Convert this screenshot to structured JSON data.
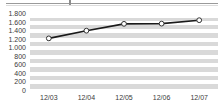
{
  "chart_data": {
    "type": "line",
    "title": "",
    "subtitle": "",
    "xlabel": "",
    "ylabel": "",
    "categories": [
      "12/03",
      "12/04",
      "12/05",
      "12/06",
      "12/07"
    ],
    "values": [
      1230,
      1410,
      1570,
      1575,
      1655
    ],
    "series": [
      {
        "name": "",
        "values": [
          1230,
          1410,
          1570,
          1575,
          1655
        ]
      }
    ],
    "ytick_labels": [
      "1.800",
      "1.600",
      "1.400",
      "1.200",
      "1.000",
      "800",
      "600",
      "400",
      "200",
      "0"
    ],
    "ytick_values": [
      1800,
      1600,
      1400,
      1200,
      1000,
      800,
      600,
      400,
      200,
      0
    ],
    "ylim": [
      0,
      1800
    ],
    "grid": true,
    "grid_style": "horizontal-banded",
    "legend": "none",
    "marker": "open-circle",
    "colors": {
      "line": "#1a1a1a",
      "marker_fill": "#ffffff",
      "marker_stroke": "#333333",
      "plot_band": "#d9d9d9",
      "plot_gridline": "#ffffff",
      "axis_text": "#3a3a3a",
      "background": "#ffffff",
      "top_rule": "#9a9a9a"
    }
  },
  "decorations": {
    "top_rule_name": "clipped-top-rule"
  }
}
